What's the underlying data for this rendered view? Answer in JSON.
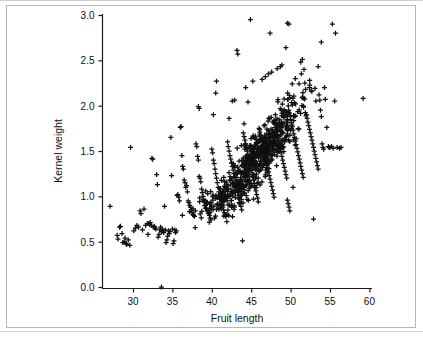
{
  "figure": {
    "kind": "scatter-plot",
    "background_color": "#ffffff",
    "border_color": "#b7b7b7",
    "marker_color": "#101010",
    "axis_color": "#1a1a1a"
  },
  "chart_data": {
    "type": "scatter",
    "title": "",
    "subtitle": "",
    "xlabel": "Fruit length",
    "ylabel": "Kernel weight",
    "xlim": [
      26.0,
      61.5
    ],
    "ylim": [
      -0.16,
      3.12
    ],
    "xticks": [
      30,
      35,
      40,
      45,
      50,
      55,
      60
    ],
    "xtick_labels": [
      "30",
      "35",
      "40",
      "45",
      "50",
      "55",
      "60"
    ],
    "yticks": [
      0.0,
      0.5,
      1.0,
      1.5,
      2.0,
      2.5,
      3.0
    ],
    "ytick_labels": [
      "0.0",
      "0.5",
      "1.0",
      "1.5",
      "2.0",
      "2.5",
      "3.0"
    ],
    "grid": false,
    "legend": null,
    "marker": "+",
    "marker_size": 5,
    "annotations": [],
    "series": [
      {
        "name": "observations",
        "marker": "+",
        "color": "#101010",
        "n_points": 980,
        "correlation_note": "strong positive association",
        "points": [
          [
            33.6,
            0.0
          ],
          [
            27.1,
            0.89
          ],
          [
            28.0,
            0.57
          ],
          [
            28.1,
            0.53
          ],
          [
            28.3,
            0.66
          ],
          [
            28.4,
            0.67
          ],
          [
            28.6,
            0.59
          ],
          [
            28.7,
            0.49
          ],
          [
            28.9,
            0.5
          ],
          [
            29.0,
            0.54
          ],
          [
            29.1,
            0.48
          ],
          [
            29.2,
            0.47
          ],
          [
            29.4,
            0.52
          ],
          [
            29.6,
            0.46
          ],
          [
            29.7,
            1.54
          ],
          [
            30.1,
            0.62
          ],
          [
            30.3,
            0.65
          ],
          [
            30.5,
            0.68
          ],
          [
            30.7,
            0.66
          ],
          [
            30.9,
            0.84
          ],
          [
            31.0,
            0.81
          ],
          [
            31.2,
            0.63
          ],
          [
            31.4,
            0.86
          ],
          [
            31.6,
            0.68
          ],
          [
            31.8,
            0.7
          ],
          [
            31.9,
            0.58
          ],
          [
            32.0,
            0.7
          ],
          [
            32.1,
            0.69
          ],
          [
            32.2,
            0.71
          ],
          [
            32.3,
            0.68
          ],
          [
            32.4,
            1.42
          ],
          [
            32.5,
            1.41
          ],
          [
            32.6,
            0.66
          ],
          [
            32.7,
            0.67
          ],
          [
            32.8,
            0.65
          ],
          [
            32.9,
            0.64
          ],
          [
            33.0,
            1.24
          ],
          [
            33.1,
            1.13
          ],
          [
            33.2,
            0.55
          ],
          [
            33.3,
            0.58
          ],
          [
            33.4,
            0.63
          ],
          [
            33.5,
            0.66
          ],
          [
            33.6,
            0.61
          ],
          [
            33.7,
            0.64
          ],
          [
            33.8,
            0.62
          ],
          [
            33.9,
            0.6
          ],
          [
            34.0,
            0.89
          ],
          [
            34.1,
            0.63
          ],
          [
            34.2,
            0.49
          ],
          [
            34.3,
            0.52
          ],
          [
            34.4,
            0.56
          ],
          [
            34.5,
            0.62
          ],
          [
            34.6,
            0.59
          ],
          [
            34.7,
            0.61
          ],
          [
            34.8,
            1.65
          ],
          [
            34.9,
            1.23
          ],
          [
            35.0,
            0.64
          ],
          [
            35.1,
            0.48
          ],
          [
            35.2,
            0.51
          ],
          [
            35.3,
            0.63
          ],
          [
            35.4,
            0.6
          ],
          [
            35.5,
            0.62
          ],
          [
            35.6,
            1.01
          ],
          [
            35.7,
            1.02
          ],
          [
            35.8,
            0.99
          ],
          [
            35.9,
            0.95
          ],
          [
            36.0,
            1.76
          ],
          [
            36.1,
            1.77
          ],
          [
            36.2,
            1.45
          ],
          [
            36.3,
            1.33
          ],
          [
            36.4,
            1.3
          ],
          [
            36.5,
            1.18
          ],
          [
            36.6,
            1.15
          ],
          [
            36.7,
            1.1
          ],
          [
            36.8,
            1.12
          ],
          [
            36.9,
            1.05
          ],
          [
            37.0,
            0.95
          ],
          [
            37.1,
            0.93
          ],
          [
            37.2,
            0.9
          ],
          [
            37.3,
            0.88
          ],
          [
            37.4,
            0.85
          ],
          [
            37.5,
            0.82
          ],
          [
            37.6,
            0.8
          ],
          [
            37.7,
            0.79
          ],
          [
            37.8,
            0.78
          ],
          [
            37.9,
            0.84
          ],
          [
            38.0,
            1.58
          ],
          [
            38.1,
            1.55
          ],
          [
            38.2,
            1.44
          ],
          [
            38.3,
            1.4
          ],
          [
            38.4,
            1.22
          ],
          [
            38.5,
            1.2
          ],
          [
            38.6,
            1.16
          ],
          [
            38.7,
            1.08
          ],
          [
            38.8,
            1.04
          ],
          [
            38.9,
            1.0
          ],
          [
            38.3,
            1.99
          ],
          [
            38.4,
            1.97
          ],
          [
            39.0,
            0.96
          ],
          [
            39.1,
            0.93
          ],
          [
            39.2,
            0.9
          ],
          [
            39.3,
            0.87
          ],
          [
            39.4,
            0.85
          ],
          [
            39.5,
            0.83
          ],
          [
            39.6,
            0.81
          ],
          [
            39.7,
            0.79
          ],
          [
            39.8,
            0.76
          ],
          [
            39.9,
            0.74
          ],
          [
            40.0,
            1.52
          ],
          [
            40.1,
            1.48
          ],
          [
            40.2,
            1.4
          ],
          [
            40.3,
            1.36
          ],
          [
            40.4,
            1.3
          ],
          [
            40.5,
            1.25
          ],
          [
            40.6,
            1.2
          ],
          [
            40.7,
            1.15
          ],
          [
            40.8,
            1.1
          ],
          [
            40.9,
            1.05
          ],
          [
            40.2,
            1.9
          ],
          [
            40.5,
            2.14
          ],
          [
            40.6,
            2.27
          ],
          [
            41.0,
            1.0
          ],
          [
            41.1,
            0.97
          ],
          [
            41.2,
            0.94
          ],
          [
            41.3,
            0.91
          ],
          [
            41.4,
            0.88
          ],
          [
            41.5,
            0.85
          ],
          [
            41.6,
            0.82
          ],
          [
            41.7,
            0.8
          ],
          [
            41.8,
            0.78
          ],
          [
            41.9,
            0.72
          ],
          [
            42.0,
            1.6
          ],
          [
            42.1,
            1.55
          ],
          [
            42.2,
            1.5
          ],
          [
            42.3,
            1.45
          ],
          [
            42.4,
            1.41
          ],
          [
            42.5,
            1.37
          ],
          [
            42.6,
            1.33
          ],
          [
            42.7,
            1.29
          ],
          [
            42.8,
            1.25
          ],
          [
            42.9,
            1.21
          ],
          [
            42.2,
            1.86
          ],
          [
            42.6,
            2.05
          ],
          [
            42.9,
            2.06
          ],
          [
            43.0,
            1.17
          ],
          [
            43.1,
            1.13
          ],
          [
            43.2,
            1.09
          ],
          [
            43.3,
            1.05
          ],
          [
            43.4,
            1.01
          ],
          [
            43.5,
            0.97
          ],
          [
            43.6,
            0.93
          ],
          [
            43.7,
            0.89
          ],
          [
            43.8,
            0.85
          ],
          [
            43.9,
            0.51
          ],
          [
            43.2,
            2.61
          ],
          [
            43.3,
            2.57
          ],
          [
            44.0,
            1.7
          ],
          [
            44.1,
            1.66
          ],
          [
            44.2,
            1.62
          ],
          [
            44.3,
            1.58
          ],
          [
            44.4,
            1.54
          ],
          [
            44.5,
            1.5
          ],
          [
            44.6,
            1.46
          ],
          [
            44.7,
            1.42
          ],
          [
            44.8,
            1.38
          ],
          [
            44.9,
            1.34
          ],
          [
            44.3,
            2.2
          ],
          [
            44.6,
            2.04
          ],
          [
            44.1,
            1.8
          ],
          [
            45.0,
            1.3
          ],
          [
            45.1,
            1.26
          ],
          [
            45.2,
            1.22
          ],
          [
            45.3,
            1.18
          ],
          [
            45.4,
            1.14
          ],
          [
            45.5,
            1.1
          ],
          [
            45.6,
            1.06
          ],
          [
            45.7,
            1.02
          ],
          [
            45.8,
            0.98
          ],
          [
            45.9,
            0.94
          ],
          [
            44.9,
            2.95
          ],
          [
            45.2,
            2.27
          ],
          [
            46.0,
            1.75
          ],
          [
            46.1,
            1.71
          ],
          [
            46.2,
            1.67
          ],
          [
            46.3,
            1.63
          ],
          [
            46.4,
            1.59
          ],
          [
            46.5,
            1.55
          ],
          [
            46.6,
            1.51
          ],
          [
            46.7,
            1.47
          ],
          [
            46.8,
            1.43
          ],
          [
            46.9,
            1.39
          ],
          [
            46.4,
            2.29
          ],
          [
            46.8,
            2.32
          ],
          [
            47.0,
            1.35
          ],
          [
            47.1,
            1.31
          ],
          [
            47.2,
            1.27
          ],
          [
            47.3,
            1.23
          ],
          [
            47.4,
            1.19
          ],
          [
            47.5,
            1.15
          ],
          [
            47.6,
            1.11
          ],
          [
            47.7,
            1.07
          ],
          [
            47.8,
            1.03
          ],
          [
            47.9,
            0.99
          ],
          [
            47.2,
            2.35
          ],
          [
            47.6,
            2.37
          ],
          [
            47.4,
            2.8
          ],
          [
            48.0,
            1.8
          ],
          [
            48.1,
            1.76
          ],
          [
            48.2,
            1.72
          ],
          [
            48.3,
            1.68
          ],
          [
            48.4,
            1.64
          ],
          [
            48.5,
            1.6
          ],
          [
            48.6,
            1.56
          ],
          [
            48.7,
            1.52
          ],
          [
            48.8,
            1.48
          ],
          [
            48.9,
            1.44
          ],
          [
            48.3,
            2.41
          ],
          [
            48.7,
            2.43
          ],
          [
            48.9,
            2.45
          ],
          [
            49.0,
            1.4
          ],
          [
            49.1,
            1.36
          ],
          [
            49.2,
            1.32
          ],
          [
            49.3,
            1.28
          ],
          [
            49.4,
            1.24
          ],
          [
            49.5,
            1.2
          ],
          [
            49.6,
            0.96
          ],
          [
            49.7,
            0.92
          ],
          [
            49.8,
            0.88
          ],
          [
            49.9,
            0.84
          ],
          [
            49.4,
            2.64
          ],
          [
            49.6,
            2.91
          ],
          [
            49.8,
            2.9
          ],
          [
            50.0,
            1.85
          ],
          [
            50.1,
            1.81
          ],
          [
            50.2,
            1.77
          ],
          [
            50.3,
            1.73
          ],
          [
            50.4,
            1.69
          ],
          [
            50.5,
            1.65
          ],
          [
            50.6,
            1.61
          ],
          [
            50.7,
            1.57
          ],
          [
            50.8,
            1.53
          ],
          [
            50.9,
            1.49
          ],
          [
            50.2,
            2.24
          ],
          [
            50.6,
            2.3
          ],
          [
            50.3,
            1.1
          ],
          [
            51.0,
            1.45
          ],
          [
            51.1,
            1.41
          ],
          [
            51.2,
            1.37
          ],
          [
            51.3,
            1.33
          ],
          [
            51.4,
            1.29
          ],
          [
            51.5,
            1.25
          ],
          [
            51.6,
            1.21
          ],
          [
            51.7,
            2.4
          ],
          [
            51.8,
            2.25
          ],
          [
            51.9,
            2.18
          ],
          [
            51.3,
            2.48
          ],
          [
            51.5,
            2.51
          ],
          [
            52.0,
            1.9
          ],
          [
            52.1,
            1.86
          ],
          [
            52.2,
            1.82
          ],
          [
            52.3,
            1.78
          ],
          [
            52.4,
            1.74
          ],
          [
            52.5,
            1.7
          ],
          [
            52.6,
            1.66
          ],
          [
            52.7,
            1.62
          ],
          [
            52.8,
            1.58
          ],
          [
            52.9,
            1.54
          ],
          [
            52.4,
            2.2
          ],
          [
            52.7,
            2.16
          ],
          [
            52.9,
            0.75
          ],
          [
            53.0,
            1.5
          ],
          [
            53.1,
            1.46
          ],
          [
            53.2,
            1.42
          ],
          [
            53.3,
            1.38
          ],
          [
            53.4,
            1.34
          ],
          [
            53.5,
            1.3
          ],
          [
            53.6,
            2.12
          ],
          [
            53.7,
            2.06
          ],
          [
            53.8,
            1.95
          ],
          [
            53.9,
            1.88
          ],
          [
            54.0,
            1.58
          ],
          [
            54.1,
            1.54
          ],
          [
            54.2,
            1.52
          ],
          [
            54.3,
            2.2
          ],
          [
            54.4,
            2.07
          ],
          [
            54.6,
            1.76
          ],
          [
            54.8,
            1.55
          ],
          [
            54.9,
            1.54
          ],
          [
            53.9,
            2.7
          ],
          [
            55.3,
            2.9
          ],
          [
            55.7,
            2.8
          ],
          [
            55.0,
            1.54
          ],
          [
            55.2,
            1.55
          ],
          [
            55.4,
            1.53
          ],
          [
            55.6,
            2.05
          ],
          [
            55.9,
            1.54
          ],
          [
            56.2,
            1.53
          ],
          [
            56.4,
            1.54
          ],
          [
            59.2,
            2.08
          ]
        ]
      }
    ]
  }
}
